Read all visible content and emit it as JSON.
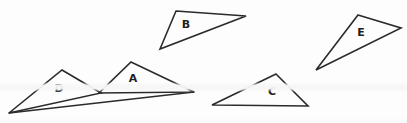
{
  "figure": {
    "name": "labelled-triangles-figure",
    "background_color": "#fdfdfd",
    "stroke_color": "#2b2b2b",
    "label_color": "#1f1f1f",
    "width": 407,
    "height": 123
  },
  "chart_data": {
    "type": "diagram",
    "title": "",
    "shapes": [
      {
        "id": "triangle-a",
        "label": "A",
        "points": [
          [
            131,
            62
          ],
          [
            194,
            92
          ],
          [
            99,
            93
          ]
        ],
        "label_pos": [
          133,
          79
        ]
      },
      {
        "id": "triangle-b",
        "label": "B",
        "points": [
          [
            176,
            11
          ],
          [
            246,
            16
          ],
          [
            160,
            49
          ]
        ],
        "label_pos": [
          186,
          25
        ]
      },
      {
        "id": "triangle-c",
        "label": "C",
        "points": [
          [
            276,
            74
          ],
          [
            308,
            106
          ],
          [
            212,
            105
          ]
        ],
        "label_pos": [
          272,
          92
        ]
      },
      {
        "id": "triangle-d",
        "label": "D",
        "points": [
          [
            62,
            70
          ],
          [
            101,
            93
          ],
          [
            9,
            113
          ]
        ],
        "label_pos": [
          59,
          89
        ]
      },
      {
        "id": "triangle-e",
        "label": "E",
        "points": [
          [
            358,
            15
          ],
          [
            401,
            28
          ],
          [
            316,
            70
          ]
        ],
        "label_pos": [
          361,
          33
        ]
      }
    ],
    "extra_lines": [
      {
        "id": "d-base-extension",
        "points": [
          [
            9,
            113
          ],
          [
            194,
            92
          ]
        ]
      }
    ],
    "labels": [
      "A",
      "B",
      "C",
      "D",
      "E"
    ]
  }
}
